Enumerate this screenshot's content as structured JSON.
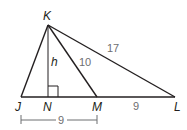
{
  "diagram": {
    "type": "triangle-geometry",
    "points": {
      "K": {
        "label": "K",
        "x": 48,
        "y": 25
      },
      "J": {
        "label": "J",
        "x": 21,
        "y": 97
      },
      "N": {
        "label": "N",
        "x": 48,
        "y": 97
      },
      "M": {
        "label": "M",
        "x": 97,
        "y": 97
      },
      "L": {
        "label": "L",
        "x": 175,
        "y": 97
      }
    },
    "segments": [
      {
        "from": "K",
        "to": "J"
      },
      {
        "from": "K",
        "to": "N",
        "label": "h"
      },
      {
        "from": "K",
        "to": "M",
        "label": "10"
      },
      {
        "from": "K",
        "to": "L",
        "label": "17"
      },
      {
        "from": "J",
        "to": "L"
      },
      {
        "from": "M",
        "to": "L",
        "label": "9"
      }
    ],
    "labels": {
      "K": "K",
      "J": "J",
      "N": "N",
      "M": "M",
      "L": "L",
      "altitude": "h",
      "KM": "10",
      "KL": "17",
      "ML": "9",
      "JM_dimension": "9"
    },
    "right_angle_at": "N",
    "dimension": {
      "from": "J",
      "to": "M",
      "value": "9"
    },
    "colors": {
      "line": "#231f20",
      "length_text": "#6d6e71"
    }
  }
}
